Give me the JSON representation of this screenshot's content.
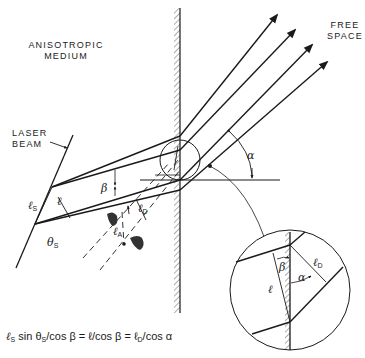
{
  "labels": {
    "medium_line1": "ANISOTROPIC",
    "medium_line2": "MEDIUM",
    "free_line1": "FREE",
    "free_line2": "SPACE",
    "laser_line1": "LASER",
    "laser_line2": "BEAM"
  },
  "symbols": {
    "ell": "ℓ",
    "ell_s": "ℓ",
    "ell_s_sub": "S",
    "ell_d": "ℓ",
    "ell_d_sub": "D",
    "ell_a": "ℓ",
    "ell_a_sub": "A",
    "theta_s": "θ",
    "theta_s_sub": "S",
    "beta": "β",
    "alpha": "α",
    "inset_beta": "β",
    "inset_alpha": "α",
    "inset_ell": "ℓ",
    "inset_ell_d": "ℓ",
    "inset_ell_d_sub": "D"
  },
  "equation": {
    "part1": "ℓ",
    "part1_sub": "S",
    "part2": " sin θ",
    "part2_sub": "S",
    "part3": "/cos β = ℓ/cos β = ℓ",
    "part3_sub": "D",
    "part4": "/cos α"
  },
  "colors": {
    "ink": "#1a1a1a",
    "background": "#ffffff"
  }
}
